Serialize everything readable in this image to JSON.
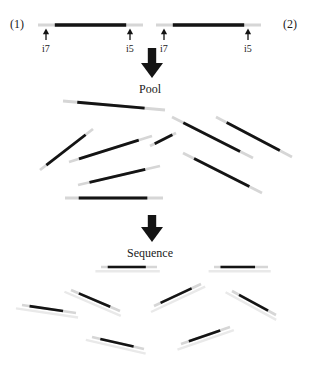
{
  "figure": {
    "title_hidden": "",
    "type": "diagram",
    "colors": {
      "dark_strand": "#141414",
      "light_strand": "#d6d6d6",
      "faint_strand": "#e9e9e9",
      "arrow": "#141414",
      "text": "#1a1a1a",
      "background": "#ffffff"
    }
  },
  "panels": {
    "amplicons": {
      "labels": [
        {
          "id": "sample-1",
          "text": "(1)",
          "x": 10,
          "y": 18
        },
        {
          "id": "sample-2",
          "text": "(2)",
          "x": 283,
          "y": 18
        }
      ],
      "index_labels": [
        {
          "id": "a1-i7",
          "text": "i7",
          "x": 42,
          "y": 44
        },
        {
          "id": "a1-i5",
          "text": "i5",
          "x": 126,
          "y": 44
        },
        {
          "id": "a2-i7",
          "text": "i7",
          "x": 160,
          "y": 44
        },
        {
          "id": "a2-i5",
          "text": "i5",
          "x": 244,
          "y": 44
        }
      ],
      "constructs": [
        {
          "id": "amplicon-1",
          "x1": 38,
          "x2": 143,
          "y": 25,
          "dark_from": 0.16,
          "dark_to": 0.84
        },
        {
          "id": "amplicon-2",
          "x1": 156,
          "x2": 261,
          "y": 25,
          "dark_from": 0.16,
          "dark_to": 0.84
        }
      ],
      "arrows": [
        {
          "id": "arrow-a1-i7",
          "x": 46,
          "y_top": 29,
          "y_bottom": 40
        },
        {
          "id": "arrow-a1-i5",
          "x": 130,
          "y_top": 29,
          "y_bottom": 40
        },
        {
          "id": "arrow-a2-i7",
          "x": 164,
          "y_top": 29,
          "y_bottom": 40
        },
        {
          "id": "arrow-a2-i5",
          "x": 248,
          "y_top": 29,
          "y_bottom": 40
        }
      ]
    },
    "pool_step": {
      "arrow": {
        "id": "pool-arrow",
        "x": 152,
        "y_top": 48,
        "y_bottom": 78
      },
      "label": {
        "id": "pool-label",
        "text": "Pool",
        "x": 139,
        "y": 83
      }
    },
    "pool_fragments": [
      {
        "id": "pool-frag-1",
        "x1": 63,
        "y1": 101,
        "x2": 165,
        "y2": 110,
        "dark_from": 0.14,
        "dark_to": 0.8
      },
      {
        "id": "pool-frag-2",
        "x1": 40,
        "y1": 170,
        "x2": 93,
        "y2": 129,
        "dark_from": 0.12,
        "dark_to": 0.86
      },
      {
        "id": "pool-frag-3",
        "x1": 69,
        "y1": 162,
        "x2": 152,
        "y2": 136,
        "dark_from": 0.12,
        "dark_to": 0.84
      },
      {
        "id": "pool-frag-4",
        "x1": 78,
        "y1": 185,
        "x2": 160,
        "y2": 166,
        "dark_from": 0.14,
        "dark_to": 0.82
      },
      {
        "id": "pool-frag-5",
        "x1": 65,
        "y1": 198,
        "x2": 163,
        "y2": 198,
        "dark_from": 0.14,
        "dark_to": 0.84
      },
      {
        "id": "pool-frag-6",
        "x1": 172,
        "y1": 117,
        "x2": 253,
        "y2": 158,
        "dark_from": 0.14,
        "dark_to": 0.84
      },
      {
        "id": "pool-frag-7",
        "x1": 216,
        "y1": 117,
        "x2": 292,
        "y2": 157,
        "dark_from": 0.14,
        "dark_to": 0.84
      },
      {
        "id": "pool-frag-8",
        "x1": 183,
        "y1": 153,
        "x2": 262,
        "y2": 193,
        "dark_from": 0.14,
        "dark_to": 0.84
      },
      {
        "id": "pool-frag-9",
        "x1": 150,
        "y1": 146,
        "x2": 176,
        "y2": 133,
        "dark_from": 0.18,
        "dark_to": 0.86
      }
    ],
    "sequence_step": {
      "arrow": {
        "id": "sequence-arrow",
        "x": 152,
        "y_top": 215,
        "y_bottom": 242
      },
      "label": {
        "id": "sequence-label",
        "text": "Sequence",
        "x": 127,
        "y": 247
      }
    },
    "sequence_reads": [
      {
        "id": "read-1",
        "x1": 101,
        "y1": 267,
        "x2": 157,
        "y2": 267,
        "dark_from": 0.12,
        "dark_to": 0.8
      },
      {
        "id": "read-2",
        "x1": 214,
        "y1": 267,
        "x2": 268,
        "y2": 267,
        "dark_from": 0.12,
        "dark_to": 0.76
      },
      {
        "id": "read-3",
        "x1": 22,
        "y1": 305,
        "x2": 76,
        "y2": 313,
        "dark_from": 0.14,
        "dark_to": 0.76
      },
      {
        "id": "read-4",
        "x1": 71,
        "y1": 290,
        "x2": 120,
        "y2": 311,
        "dark_from": 0.16,
        "dark_to": 0.8
      },
      {
        "id": "read-5",
        "x1": 92,
        "y1": 337,
        "x2": 144,
        "y2": 349,
        "dark_from": 0.16,
        "dark_to": 0.8
      },
      {
        "id": "read-6",
        "x1": 154,
        "y1": 306,
        "x2": 201,
        "y2": 284,
        "dark_from": 0.14,
        "dark_to": 0.8
      },
      {
        "id": "read-7",
        "x1": 181,
        "y1": 344,
        "x2": 230,
        "y2": 327,
        "dark_from": 0.16,
        "dark_to": 0.8
      },
      {
        "id": "read-8",
        "x1": 232,
        "y1": 291,
        "x2": 276,
        "y2": 315,
        "dark_from": 0.16,
        "dark_to": 0.82
      }
    ]
  }
}
